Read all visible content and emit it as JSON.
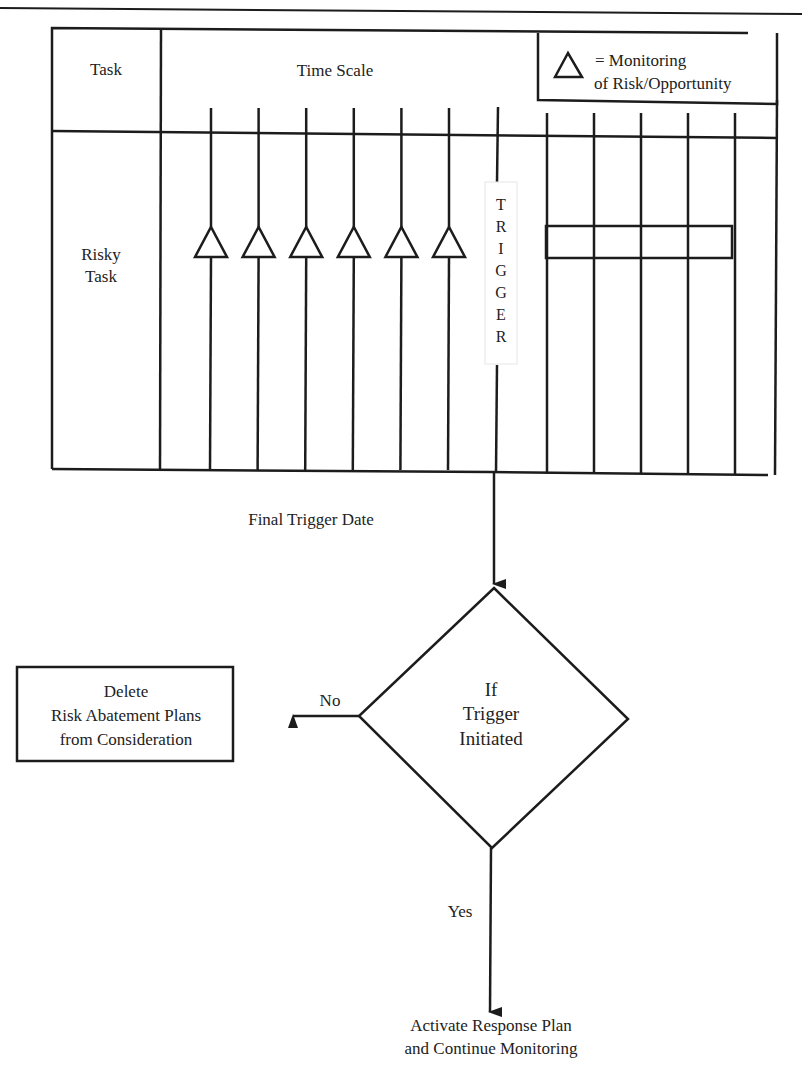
{
  "timeline_table": {
    "task_header": "Task",
    "time_scale_header": "Time Scale",
    "row_label_line1": "Risky",
    "row_label_line2": "Task",
    "monitoring_points_count": 6,
    "time_columns_after_trigger": 5,
    "trigger_letters": [
      "T",
      "R",
      "I",
      "G",
      "G",
      "E",
      "R"
    ]
  },
  "legend": {
    "icon": "triangle-icon",
    "line1": "= Monitoring",
    "line2": "of Risk/Opportunity"
  },
  "labels": {
    "final_trigger_date": "Final Trigger Date"
  },
  "decision": {
    "line1": "If",
    "line2": "Trigger",
    "line3": "Initiated",
    "no_label": "No",
    "yes_label": "Yes"
  },
  "no_outcome": {
    "line1": "Delete",
    "line2": "Risk Abatement Plans",
    "line3": "from Consideration"
  },
  "yes_outcome": {
    "line1": "Activate Response Plan",
    "line2": "and Continue Monitoring"
  }
}
